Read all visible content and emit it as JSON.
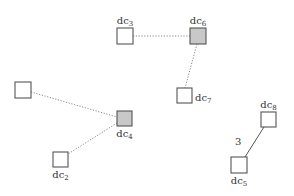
{
  "diagram": {
    "colors": {
      "background": "#ffffff",
      "box_fill": "#ffffff",
      "box_fill_highlighted": "#c8c8c8",
      "box_stroke": "#555555",
      "edge_dotted": "#888888",
      "edge_solid": "#555555",
      "text": "#333333"
    },
    "nodes": [
      {
        "id": "dc3",
        "prefix": "dc",
        "sub": "3",
        "x": 117,
        "y": 28,
        "size": 16,
        "highlighted": false,
        "label_pos": "top"
      },
      {
        "id": "dc6",
        "prefix": "dc",
        "sub": "6",
        "x": 190,
        "y": 28,
        "size": 16,
        "highlighted": true,
        "label_pos": "top"
      },
      {
        "id": "dc7",
        "prefix": "dc",
        "sub": "7",
        "x": 177,
        "y": 88,
        "size": 15,
        "highlighted": false,
        "label_pos": "right"
      },
      {
        "id": "unlabeled",
        "prefix": "",
        "sub": "",
        "x": 15,
        "y": 82,
        "size": 16,
        "highlighted": false,
        "label_pos": "none"
      },
      {
        "id": "dc4",
        "prefix": "dc",
        "sub": "4",
        "x": 117,
        "y": 111,
        "size": 15,
        "highlighted": true,
        "label_pos": "bottom"
      },
      {
        "id": "dc2",
        "prefix": "dc",
        "sub": "2",
        "x": 53,
        "y": 152,
        "size": 15,
        "highlighted": false,
        "label_pos": "bottom"
      },
      {
        "id": "dc8",
        "prefix": "dc",
        "sub": "8",
        "x": 261,
        "y": 112,
        "size": 15,
        "highlighted": false,
        "label_pos": "top"
      },
      {
        "id": "dc5",
        "prefix": "dc",
        "sub": "5",
        "x": 231,
        "y": 157,
        "size": 16,
        "highlighted": false,
        "label_pos": "bottom"
      }
    ],
    "edges": [
      {
        "from": "dc3",
        "to": "dc6",
        "style": "dotted",
        "x1": 133,
        "y1": 36,
        "x2": 190,
        "y2": 36,
        "label": ""
      },
      {
        "from": "dc6",
        "to": "dc7",
        "style": "dotted",
        "x1": 197,
        "y1": 44,
        "x2": 185,
        "y2": 88,
        "label": ""
      },
      {
        "from": "unlabeled",
        "to": "dc4",
        "style": "dotted",
        "x1": 31,
        "y1": 92,
        "x2": 117,
        "y2": 117,
        "label": ""
      },
      {
        "from": "dc4",
        "to": "dc2",
        "style": "dotted",
        "x1": 117,
        "y1": 123,
        "x2": 68,
        "y2": 154,
        "label": ""
      },
      {
        "from": "dc8",
        "to": "dc5",
        "style": "solid",
        "x1": 264,
        "y1": 127,
        "x2": 245,
        "y2": 157,
        "label": "3",
        "label_x": 235,
        "label_y": 145
      }
    ]
  }
}
